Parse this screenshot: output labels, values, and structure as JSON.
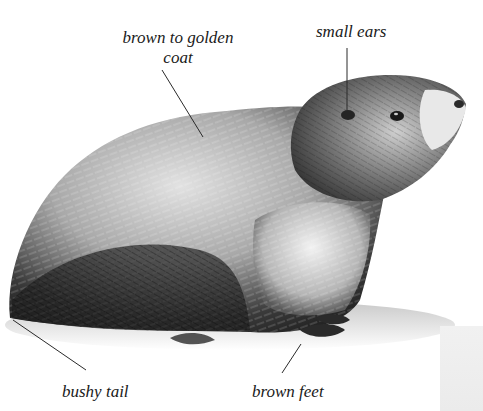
{
  "illustration": {
    "subject": "marmot",
    "style": "monochrome pen-and-ink fur illustration",
    "palette": {
      "ink": "#1a1a1a",
      "dark_fur": "#2b2b2b",
      "mid_fur": "#7a7a7a",
      "light_fur": "#d4d4d4",
      "background": "#ffffff",
      "edge_strip": "#eeeeee"
    }
  },
  "callouts": [
    {
      "id": "coat",
      "label": "brown to golden\ncoat",
      "line_1": "brown to golden",
      "line_2": "coat"
    },
    {
      "id": "ears",
      "label": "small ears"
    },
    {
      "id": "tail",
      "label": "bushy tail"
    },
    {
      "id": "feet",
      "label": "brown feet"
    }
  ]
}
